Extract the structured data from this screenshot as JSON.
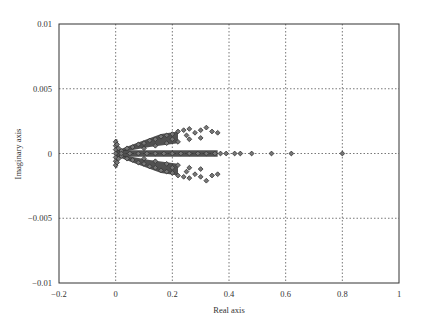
{
  "chart_data": {
    "type": "scatter",
    "title": "",
    "xlabel": "Real axis",
    "ylabel": "Imaginary axis",
    "xlim": [
      -0.2,
      1
    ],
    "ylim": [
      -0.01,
      0.01
    ],
    "xticks": [
      -0.2,
      0,
      0.2,
      0.4,
      0.6,
      0.8,
      1
    ],
    "yticks": [
      -0.01,
      -0.005,
      0,
      0.005,
      0.01
    ],
    "xtick_labels": [
      "−0.2",
      "0",
      "0.2",
      "0.4",
      "0.6",
      "0.8",
      "1"
    ],
    "ytick_labels": [
      "−0.01",
      "−0.005",
      "0",
      "0.005",
      "0.01"
    ],
    "grid": true,
    "grid_style": "dotted",
    "legend": null,
    "marker": "diamond",
    "marker_color": "#333333",
    "series": [
      {
        "name": "cluster-near-zero",
        "points": [
          [
            0.0,
            0.0009
          ],
          [
            0.0,
            0.0006
          ],
          [
            0.0,
            0.0003
          ],
          [
            0.0,
            0.0
          ],
          [
            0.0,
            -0.0003
          ],
          [
            0.0,
            -0.0006
          ],
          [
            0.0,
            -0.0009
          ],
          [
            0.005,
            0.0007
          ],
          [
            0.005,
            -0.0007
          ],
          [
            0.01,
            0.0004
          ],
          [
            0.01,
            -0.0004
          ]
        ]
      },
      {
        "name": "upper-branch",
        "points": [
          [
            0.02,
            0.0002
          ],
          [
            0.04,
            0.0004
          ],
          [
            0.06,
            0.0005
          ],
          [
            0.08,
            0.0007
          ],
          [
            0.1,
            0.0008
          ],
          [
            0.12,
            0.001
          ],
          [
            0.14,
            0.0011
          ],
          [
            0.16,
            0.0013
          ],
          [
            0.18,
            0.0014
          ],
          [
            0.2,
            0.0015
          ],
          [
            0.22,
            0.0017
          ],
          [
            0.24,
            0.0018
          ],
          [
            0.26,
            0.0019
          ],
          [
            0.28,
            0.0016
          ],
          [
            0.3,
            0.0018
          ],
          [
            0.32,
            0.002
          ],
          [
            0.34,
            0.0017
          ],
          [
            0.36,
            0.0016
          ],
          [
            0.1,
            0.0004
          ],
          [
            0.14,
            0.0006
          ],
          [
            0.18,
            0.0008
          ],
          [
            0.22,
            0.0009
          ],
          [
            0.26,
            0.0011
          ],
          [
            0.3,
            0.0012
          ],
          [
            0.25,
            0.0014
          ],
          [
            0.2,
            0.0011
          ]
        ]
      },
      {
        "name": "lower-branch",
        "points": [
          [
            0.02,
            -0.0002
          ],
          [
            0.04,
            -0.0004
          ],
          [
            0.06,
            -0.0005
          ],
          [
            0.08,
            -0.0007
          ],
          [
            0.1,
            -0.0008
          ],
          [
            0.12,
            -0.001
          ],
          [
            0.14,
            -0.0011
          ],
          [
            0.16,
            -0.0013
          ],
          [
            0.18,
            -0.0014
          ],
          [
            0.2,
            -0.0015
          ],
          [
            0.22,
            -0.0017
          ],
          [
            0.24,
            -0.0018
          ],
          [
            0.26,
            -0.0019
          ],
          [
            0.28,
            -0.0016
          ],
          [
            0.3,
            -0.0018
          ],
          [
            0.32,
            -0.0021
          ],
          [
            0.34,
            -0.0017
          ],
          [
            0.36,
            -0.0016
          ],
          [
            0.1,
            -0.0004
          ],
          [
            0.14,
            -0.0006
          ],
          [
            0.18,
            -0.0008
          ],
          [
            0.22,
            -0.0009
          ],
          [
            0.26,
            -0.0011
          ],
          [
            0.3,
            -0.0012
          ],
          [
            0.25,
            -0.0014
          ],
          [
            0.2,
            -0.0011
          ]
        ]
      },
      {
        "name": "real-axis",
        "points": [
          [
            0.02,
            0
          ],
          [
            0.05,
            0
          ],
          [
            0.08,
            0
          ],
          [
            0.11,
            0
          ],
          [
            0.14,
            0
          ],
          [
            0.17,
            0
          ],
          [
            0.2,
            0
          ],
          [
            0.23,
            0
          ],
          [
            0.26,
            0
          ],
          [
            0.29,
            0
          ],
          [
            0.32,
            0
          ],
          [
            0.35,
            0
          ],
          [
            0.37,
            0
          ],
          [
            0.39,
            0
          ],
          [
            0.42,
            0
          ],
          [
            0.44,
            0
          ],
          [
            0.48,
            0
          ],
          [
            0.55,
            0
          ],
          [
            0.62,
            0
          ],
          [
            0.8,
            0
          ]
        ]
      }
    ]
  }
}
